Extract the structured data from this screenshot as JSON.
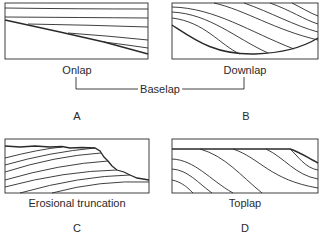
{
  "figure": {
    "stroke_color": "#2a2a2a",
    "panels": [
      {
        "id": "A",
        "label": "Onlap",
        "letter": "A"
      },
      {
        "id": "B",
        "label": "Downlap",
        "letter": "B"
      },
      {
        "id": "C",
        "label": "Erosional truncation",
        "letter": "C"
      },
      {
        "id": "D",
        "label": "Toplap",
        "letter": "D"
      }
    ],
    "group_label": "Baselap"
  }
}
